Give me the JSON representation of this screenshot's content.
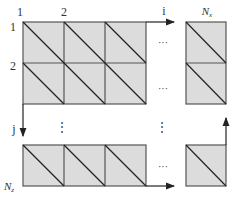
{
  "diagram": {
    "title": "",
    "colors": {
      "cell_fill": "#dcdcdc",
      "cell_stroke": "#555555",
      "diagonal": "#222222",
      "arrow": "#222222",
      "text": "#333333"
    },
    "column_labels": [
      "1",
      "2"
    ],
    "row_labels": [
      "1",
      "2"
    ],
    "axis_i_label": "i",
    "axis_j_label": "j",
    "last_column_label": "N",
    "last_column_sub": "x",
    "last_row_label": "N",
    "last_row_sub": "z",
    "ellipsis_h": "···",
    "ellipsis_v": "⋮",
    "grid": {
      "top_block": {
        "cols": 3,
        "rows": 2
      },
      "bottom_block": {
        "cols": 3,
        "rows": 1
      },
      "right_column_top": {
        "cols": 1,
        "rows": 2
      },
      "right_column_bottom": {
        "cols": 1,
        "rows": 1
      },
      "cell_split": "diagonal top-left to bottom-right"
    }
  }
}
